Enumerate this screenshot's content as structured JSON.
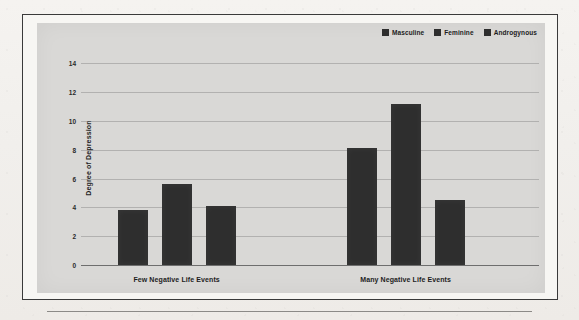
{
  "chart_data": {
    "type": "bar",
    "title": "",
    "xlabel": "",
    "ylabel": "Degree of Depression",
    "ylim": [
      0,
      15
    ],
    "yticks": [
      0,
      2,
      4,
      6,
      8,
      10,
      12,
      14
    ],
    "ytick_labels": [
      "0",
      "2",
      "4",
      "6",
      "8",
      "10",
      "12",
      "14"
    ],
    "grid": true,
    "legend_position": "top-right",
    "categories": [
      "Few Negative Life Events",
      "Many Negative Life Events"
    ],
    "series": [
      {
        "name": "Masculine",
        "color": "#2e2e2e",
        "values": [
          3.8,
          8.1
        ]
      },
      {
        "name": "Feminine",
        "color": "#2e2e2e",
        "values": [
          5.6,
          11.2
        ]
      },
      {
        "name": "Androgynous",
        "color": "#2e2e2e",
        "values": [
          4.1,
          4.5
        ]
      }
    ]
  },
  "figure": {
    "border_color": "#3a3a3a",
    "plot_background": "#d9d8d6",
    "page_background": "#f3f1ee"
  }
}
